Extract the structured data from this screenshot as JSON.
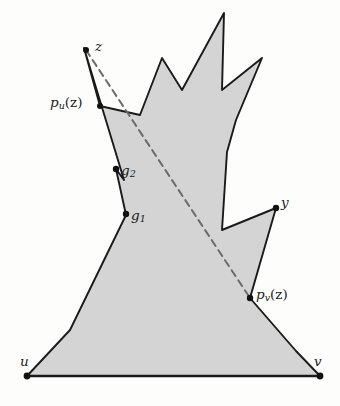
{
  "figure": {
    "type": "geometry-diagram",
    "colors": {
      "polygon_fill": "#d4d4d4",
      "polygon_stroke": "#1a1a1a",
      "background": "#fdfdfc",
      "dashed_line": "#6b6b6b",
      "label_text": "#1a1a1a",
      "vertex_dot": "#111111"
    },
    "canvas": {
      "width": 340,
      "height": 406
    },
    "polygon": {
      "name": "shaded-polygon",
      "points": "27,376 320,376 296,351 250,298 276,208 222,230 227,152 236,120 262,58 222,90 224,13 182,90 162,58 140,115 100,106 84,48 124,180 116,169 126,215 70,330"
    },
    "dashed_path": {
      "name": "shortest-path-z-to-pv",
      "from": "z",
      "to": "p_v(z)",
      "points": "86,50 250,298",
      "dash": "7,5"
    },
    "labels": [
      {
        "id": "z",
        "text": "z",
        "kind": "plain",
        "x": 95,
        "y": 40,
        "dot_x": 86,
        "dot_y": 50
      },
      {
        "id": "pu",
        "text": "p",
        "sub": "u",
        "arg": "(z)",
        "kind": "function",
        "x": 50,
        "y": 96,
        "dot_x": 100,
        "dot_y": 106
      },
      {
        "id": "g2",
        "text": "g",
        "sub": "2",
        "kind": "subscript",
        "x": 121,
        "y": 164,
        "dot_x": 116,
        "dot_y": 169
      },
      {
        "id": "g1",
        "text": "g",
        "sub": "1",
        "kind": "subscript",
        "x": 131,
        "y": 209,
        "dot_x": 126,
        "dot_y": 214
      },
      {
        "id": "y",
        "text": "y",
        "kind": "plain",
        "x": 281,
        "y": 196,
        "dot_x": 276,
        "dot_y": 208
      },
      {
        "id": "pv",
        "text": "p",
        "sub": "v",
        "arg": "(z)",
        "kind": "function",
        "x": 256,
        "y": 288,
        "dot_x": 250,
        "dot_y": 298
      },
      {
        "id": "u",
        "text": "u",
        "kind": "plain",
        "x": 20,
        "y": 355,
        "dot_x": 27,
        "dot_y": 376
      },
      {
        "id": "v",
        "text": "v",
        "kind": "plain",
        "x": 314,
        "y": 355,
        "dot_x": 320,
        "dot_y": 376
      }
    ],
    "vertex_dots": [
      {
        "name": "vertex-dot-z",
        "x": 86,
        "y": 50,
        "r": 3.0
      },
      {
        "name": "vertex-dot-pu",
        "x": 100,
        "y": 106,
        "r": 3.0
      },
      {
        "name": "vertex-dot-g2",
        "x": 116,
        "y": 169,
        "r": 3.2
      },
      {
        "name": "vertex-dot-g1",
        "x": 126,
        "y": 214,
        "r": 3.2
      },
      {
        "name": "vertex-dot-y",
        "x": 276,
        "y": 208,
        "r": 3.2
      },
      {
        "name": "vertex-dot-pv",
        "x": 250,
        "y": 298,
        "r": 3.2
      },
      {
        "name": "vertex-dot-u",
        "x": 27,
        "y": 376,
        "r": 3.4
      },
      {
        "name": "vertex-dot-v",
        "x": 320,
        "y": 376,
        "r": 3.4
      }
    ],
    "baseline_segment": {
      "name": "uv-base-segment",
      "x1": 27,
      "y1": 376,
      "x2": 320,
      "y2": 376
    }
  }
}
